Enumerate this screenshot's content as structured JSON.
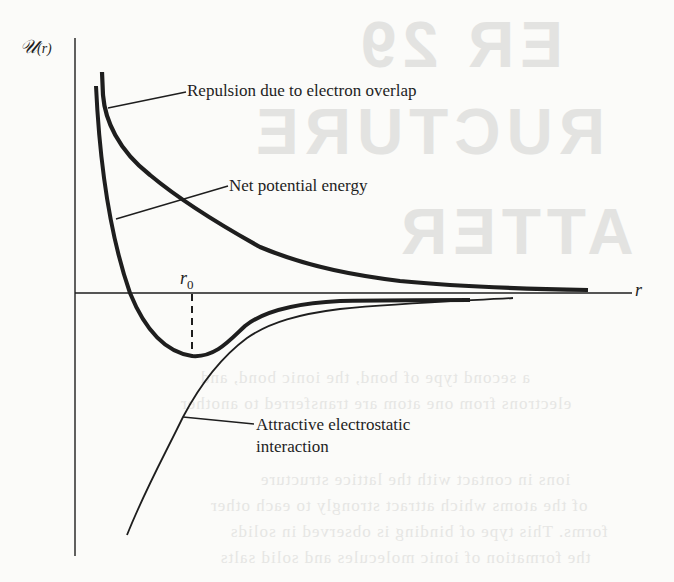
{
  "figure": {
    "y_axis_label": "𝒰",
    "y_axis_arg": "(r)",
    "x_axis_label": "r",
    "equilibrium_label": "r",
    "equilibrium_subscript": "0",
    "annotations": {
      "repulsion": "Repulsion due to electron overlap",
      "net": "Net potential energy",
      "attractive_line1": "Attractive electrostatic",
      "attractive_line2": "interaction"
    },
    "colors": {
      "ink": "#1e1e1e",
      "paper": "#fbfbf9",
      "bleed_through": "#e3e3e1"
    }
  },
  "background_bleed": {
    "heading_1": "ER 29",
    "heading_2": "RUCTURE",
    "heading_3": "ATTER",
    "body_lines": [
      "a second type of bond, the ionic bond, and",
      "electrons from one atom are transferred to another",
      "ions in contact with the lattice structure",
      "of the atoms which attract strongly to each other",
      "forms. This type of binding is observed in solids",
      "the formation of ionic molecules and solid salts"
    ]
  }
}
